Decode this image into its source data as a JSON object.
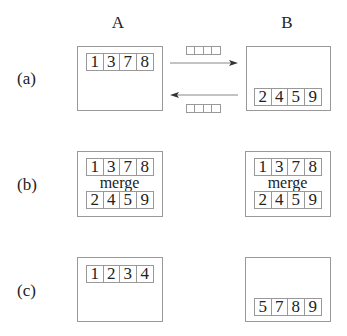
{
  "columns": {
    "a": "A",
    "b": "B"
  },
  "rows": [
    {
      "label": "(a)",
      "a": {
        "cells": [
          "1",
          "3",
          "7",
          "8"
        ]
      },
      "b": {
        "cells": [
          "2",
          "4",
          "5",
          "9"
        ]
      }
    },
    {
      "label": "(b)",
      "a": {
        "top": [
          "1",
          "3",
          "7",
          "8"
        ],
        "merge": "merge",
        "bottom": [
          "2",
          "4",
          "5",
          "9"
        ]
      },
      "b": {
        "top": [
          "1",
          "3",
          "7",
          "8"
        ],
        "merge": "merge",
        "bottom": [
          "2",
          "4",
          "5",
          "9"
        ]
      }
    },
    {
      "label": "(c)",
      "a": {
        "cells": [
          "1",
          "2",
          "3",
          "4"
        ]
      },
      "b": {
        "cells": [
          "5",
          "7",
          "8",
          "9"
        ]
      }
    }
  ],
  "colors": {
    "line": "#999999",
    "text": "#222222",
    "arrow": "#333333"
  }
}
